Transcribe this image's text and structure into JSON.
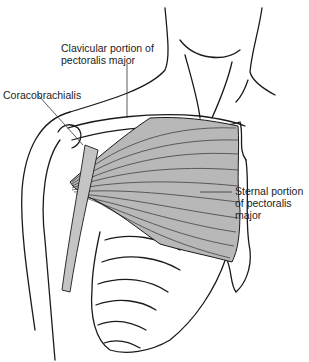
{
  "figure": {
    "colors": {
      "line": "#1a1a1a",
      "muscle_fill": "#b8b8b8",
      "background": "#ffffff"
    }
  },
  "labels": {
    "clavicular": {
      "line1": "Clavicular portion of",
      "line2": "pectoralis major"
    },
    "coracobrachialis": {
      "text": "Coracobrachialis"
    },
    "sternal": {
      "line1": "Sternal portion",
      "line2": "of pectoralis",
      "line3": "major"
    }
  }
}
